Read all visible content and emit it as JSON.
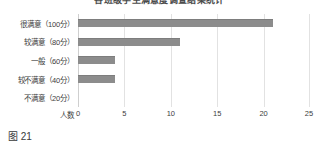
{
  "figure": {
    "caption": "图 21",
    "title_clipped": "各班级学生满意度调查结果统计"
  },
  "chart_data": {
    "type": "bar",
    "orientation": "horizontal",
    "title": "各班级学生满意度调查结果统计",
    "categories": [
      "很满意（100分）",
      "较满意（80分）",
      "一般（60分）",
      "较不满意（40分）",
      "不满意（20分）"
    ],
    "values": [
      21,
      11,
      4,
      4,
      0
    ],
    "xlabel": "人数",
    "ylabel": "",
    "xlim": [
      0,
      25
    ],
    "xticks": [
      "0",
      "5",
      "10",
      "15",
      "20",
      "25"
    ],
    "grid": true,
    "legend": false,
    "bar_color": "#8c8c8c",
    "gridline_color": "#e2e2e2"
  }
}
